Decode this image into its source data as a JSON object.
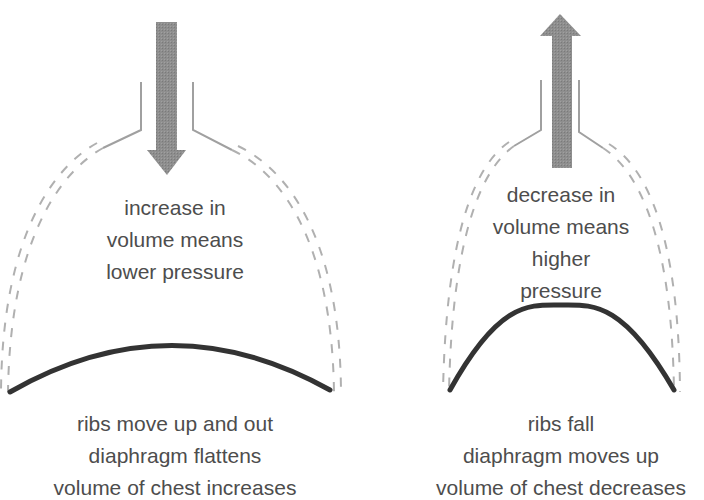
{
  "panels": [
    {
      "id": "inhalation",
      "arrow_direction": "down",
      "inner_text": [
        "increase in",
        "volume means",
        "lower pressure"
      ],
      "caption": [
        "ribs move up and out",
        "diaphragm flattens",
        "volume of chest increases"
      ]
    },
    {
      "id": "exhalation",
      "arrow_direction": "up",
      "inner_text": [
        "decrease in",
        "volume means",
        "higher",
        "pressure"
      ],
      "caption": [
        "ribs fall",
        "diaphragm moves up",
        "volume of chest decreases"
      ]
    }
  ],
  "colors": {
    "arrow": "#8c8c8c",
    "diaphragm": "#333333",
    "ribs": "#aaaaaa",
    "trachea": "#999999",
    "text": "#4d4d4d"
  }
}
